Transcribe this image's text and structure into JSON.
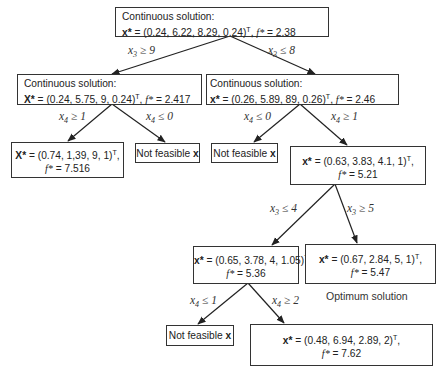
{
  "nodes": {
    "root": {
      "heading": "Continuous solution:",
      "x_label": "x*",
      "x_value": " = (0.24, 6.22, 8.29, 0.24)",
      "f_label": "f*",
      "f_value": " = 2.38"
    },
    "n1_left": {
      "heading": "Continuous solution:",
      "x_label": "X*",
      "x_value": " = (0.24, 5.75, 9, 0.24)",
      "f_label": "f*",
      "f_value": " = 2.417"
    },
    "n1_right": {
      "heading": "Continuous solution:",
      "x_label": "x*",
      "x_value": " = (0.26, 5.89, 89, 0.26)",
      "f_label": "f*",
      "f_value": " = 2.46"
    },
    "n2_a": {
      "x_label": "X*",
      "x_value": " = (0.74, 1,39, 9, 1)",
      "f_label": "f*",
      "f_value": " = 7.516"
    },
    "n2_b": {
      "text": "Not feasible ",
      "x_label": "x"
    },
    "n2_c": {
      "text": "Not feasible ",
      "x_label": "x"
    },
    "n2_d": {
      "x_label": "x*",
      "x_value": " = (0.63, 3.83, 4.1, 1)",
      "f_label": "f*",
      "f_value": " = 5.21"
    },
    "n3_a": {
      "x_label": "x*",
      "x_value": " = (0.65, 3.78, 4, 1.05)",
      "f_label": "f*",
      "f_value": " = 5.36"
    },
    "n3_b": {
      "x_label": "x*",
      "x_value": " = (0.67, 2.84, 5, 1)",
      "f_label": "f*",
      "f_value": " = 5.47",
      "note": "Optimum solution"
    },
    "n4_a": {
      "text": "Not feasible ",
      "x_label": "x"
    },
    "n4_b": {
      "x_label": "x*",
      "x_value": " = (0.48, 6.94, 2.89, 2)",
      "f_label": "f*",
      "f_value": " = 7.62"
    }
  },
  "transpose": "T",
  "edges": {
    "e_root_left": {
      "var": "x",
      "sub": "3",
      "op": " ≥ 9"
    },
    "e_root_right": {
      "var": "x",
      "sub": "3",
      "op": " ≤ 8"
    },
    "e_l_a": {
      "var": "x",
      "sub": "4",
      "op": " ≥ 1"
    },
    "e_l_b": {
      "var": "x",
      "sub": "4",
      "op": " ≤ 0"
    },
    "e_r_c": {
      "var": "x",
      "sub": "4",
      "op": " ≤ 0"
    },
    "e_r_d": {
      "var": "x",
      "sub": "4",
      "op": " ≥ 1"
    },
    "e_d_a": {
      "var": "x",
      "sub": "3",
      "op": " ≤ 4"
    },
    "e_d_b": {
      "var": "x",
      "sub": "3",
      "op": " ≥ 5"
    },
    "e_3a_a": {
      "var": "x",
      "sub": "4",
      "op": " ≤ 1"
    },
    "e_3a_b": {
      "var": "x",
      "sub": "4",
      "op": " ≥ 2"
    }
  }
}
